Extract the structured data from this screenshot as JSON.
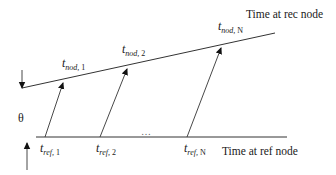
{
  "diagram": {
    "type": "timing-diagram",
    "rec_axis": {
      "label": "Time at rec node",
      "timestamps": [
        {
          "symbol": "t",
          "subscript": "nod, ",
          "index": "1"
        },
        {
          "symbol": "t",
          "subscript": "nod, ",
          "index": "2"
        },
        {
          "symbol": "t",
          "subscript": "nod, ",
          "index": "N"
        }
      ]
    },
    "ref_axis": {
      "label": "Time at ref node",
      "timestamps": [
        {
          "symbol": "t",
          "subscript": "ref, ",
          "index": "1"
        },
        {
          "symbol": "t",
          "subscript": "ref, ",
          "index": "2"
        },
        {
          "symbol": "t",
          "subscript": "ref, ",
          "index": "N"
        }
      ],
      "ellipsis": "…"
    },
    "offset_label": "θ",
    "colors": {
      "line": "#333333",
      "text": "#1a1a1a",
      "background": "#ffffff"
    }
  }
}
